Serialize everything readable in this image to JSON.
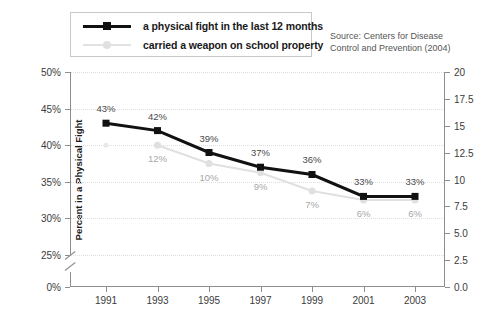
{
  "legend": {
    "entries": [
      {
        "label": "a physical fight in the last 12 months",
        "color": "#111111",
        "marker": "square-marker"
      },
      {
        "label": "carried a weapon on school property",
        "color": "#e0e0e0",
        "marker": "circle-marker"
      }
    ]
  },
  "source": {
    "line1": "Source: Centers for Disease",
    "line2": "Control and Prevention (2004)"
  },
  "chart_data": {
    "type": "line",
    "title": "",
    "xlabel": "",
    "ylabel": "Percent in a Physical Fight",
    "categories": [
      "1991",
      "1993",
      "1995",
      "1997",
      "1999",
      "2001",
      "2003"
    ],
    "series": [
      {
        "name": "a physical fight in the last 12 months",
        "color": "#111111",
        "marker": "square-marker",
        "values": [
          43,
          42,
          39,
          37,
          36,
          33,
          33
        ],
        "labels": [
          "43%",
          "42%",
          "39%",
          "37%",
          "36%",
          "33%",
          "33%"
        ]
      },
      {
        "name": "carried a weapon on school property",
        "color": "#e0e0e0",
        "marker": "circle-marker",
        "values": [
          null,
          12,
          10,
          9,
          7,
          6,
          6
        ],
        "labels": [
          "",
          "12%",
          "10%",
          "9%",
          "7%",
          "6%",
          "6%"
        ]
      }
    ],
    "ylim": [
      25,
      50
    ],
    "yticks": [
      "50%",
      "45%",
      "40%",
      "35%",
      "30%",
      "25%"
    ],
    "yticks_break": "0%",
    "y2lim": [
      0.0,
      20.0
    ],
    "y2ticks": [
      "20",
      "17.5",
      "15",
      "12.5",
      "10",
      "7.5",
      "5.0",
      "2.5",
      "0.0"
    ],
    "grid": true,
    "axis_break": true,
    "legend_position": "top-left"
  }
}
